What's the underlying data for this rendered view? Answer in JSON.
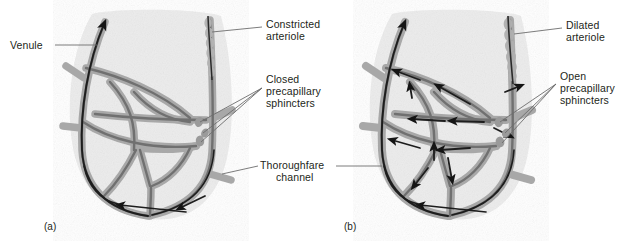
{
  "figure": {
    "background_color": "#ffffff",
    "tissue_fill": "#ebebeb",
    "vessel_wall_color": "#a6a6a6",
    "vessel_lumen_color": "#6f6f6f",
    "leader_line_color": "#6d6d6d",
    "text_color": "#231f20",
    "arrow_color": "#1a1a1a"
  },
  "panels": [
    {
      "id": "a",
      "caption": "(a)",
      "state": "constricted",
      "arteriole_label": "Constricted\narteriole",
      "sphincter_label": "Closed\nprecapillary\nsphincters",
      "flow_in_capillaries": false,
      "sphincter_count": 3
    },
    {
      "id": "b",
      "caption": "(b)",
      "state": "dilated",
      "arteriole_label": "Dilated\narteriole",
      "sphincter_label": "Open\nprecapillary\nsphincters",
      "flow_in_capillaries": true,
      "sphincter_count": 3
    }
  ],
  "labels": {
    "venule": "Venule",
    "constricted_arteriole_line1": "Constricted",
    "constricted_arteriole_line2": "arteriole",
    "closed_sphincters_line1": "Closed",
    "closed_sphincters_line2": "precapillary",
    "closed_sphincters_line3": "sphincters",
    "thoroughfare_line1": "Thoroughfare",
    "thoroughfare_line2": "channel",
    "dilated_arteriole_line1": "Dilated",
    "dilated_arteriole_line2": "arteriole",
    "open_sphincters_line1": "Open",
    "open_sphincters_line2": "precapillary",
    "open_sphincters_line3": "sphincters",
    "caption_a": "(a)",
    "caption_b": "(b)"
  }
}
